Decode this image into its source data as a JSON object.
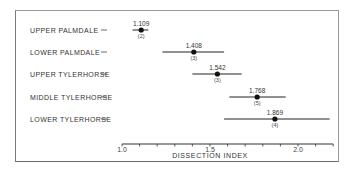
{
  "chart_data": {
    "type": "dot-whisker",
    "title": "",
    "xlabel": "DISSECTION INDEX",
    "ylabel": "",
    "xlim": [
      1.0,
      2.2
    ],
    "grid": false,
    "x_ticks": [
      {
        "value": 1.0,
        "label": "1.0"
      },
      {
        "value": 1.5,
        "label": "1.5"
      },
      {
        "value": 2.0,
        "label": "2.0"
      }
    ],
    "minor_tick_step": 0.1,
    "categories": [
      "UPPER PALMDALE",
      "LOWER PALMDALE",
      "UPPER TYLERHORSE",
      "MIDDLE TYLERHORSE",
      "LOWER TYLERHORSE"
    ],
    "series": [
      {
        "category": "UPPER PALMDALE",
        "mean": 1.109,
        "mean_label": "1.109",
        "low": 1.06,
        "high": 1.15,
        "n": 2,
        "n_label": "(2)"
      },
      {
        "category": "LOWER PALMDALE",
        "mean": 1.408,
        "mean_label": "1.408",
        "low": 1.23,
        "high": 1.58,
        "n": 3,
        "n_label": "(3)"
      },
      {
        "category": "UPPER TYLERHORSE",
        "mean": 1.542,
        "mean_label": "1.542",
        "low": 1.4,
        "high": 1.68,
        "n": 3,
        "n_label": "(3)"
      },
      {
        "category": "MIDDLE TYLERHORSE",
        "mean": 1.768,
        "mean_label": "1.768",
        "low": 1.61,
        "high": 1.93,
        "n": 5,
        "n_label": "(5)"
      },
      {
        "category": "LOWER TYLERHORSE",
        "mean": 1.869,
        "mean_label": "1.869",
        "low": 1.58,
        "high": 2.18,
        "n": 4,
        "n_label": "(4)"
      }
    ]
  }
}
